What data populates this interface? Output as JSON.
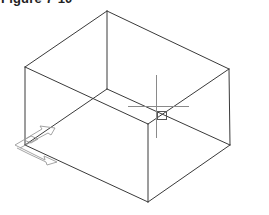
{
  "figure": {
    "title": "Figure 7-10"
  },
  "drawing": {
    "type": "isometric wireframe box",
    "line_color": "#3a3a3a",
    "cursor_color": "#8a8a8a",
    "ucs_icon_color": "#9a9a9a",
    "vertices": {
      "top": [
        107,
        11
      ],
      "right_top": [
        229,
        69
      ],
      "left_top": [
        25,
        67
      ],
      "front_top": [
        148,
        124
      ],
      "inner_bottom": [
        107,
        89
      ],
      "left_bottom": [
        25,
        145
      ],
      "right_bottom": [
        230,
        145
      ],
      "front_bottom": [
        148,
        202
      ]
    },
    "crosshair": {
      "center": [
        156,
        106
      ],
      "pickbox": [
        162,
        115
      ]
    }
  }
}
